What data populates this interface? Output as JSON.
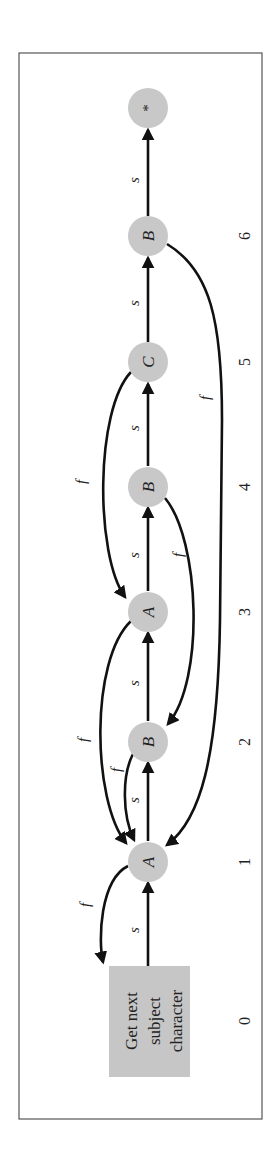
{
  "diagram": {
    "orientation": "rotated 90 degrees counter-clockwise",
    "start_box": {
      "lines": [
        "Get next",
        "subject",
        "character"
      ],
      "index": "0"
    },
    "nodes": [
      {
        "index": "1",
        "label": "A"
      },
      {
        "index": "2",
        "label": "B"
      },
      {
        "index": "3",
        "label": "A"
      },
      {
        "index": "4",
        "label": "B"
      },
      {
        "index": "5",
        "label": "C"
      },
      {
        "index": "6",
        "label": "B"
      },
      {
        "index": "7",
        "label": "*"
      }
    ],
    "success_label": "s",
    "failure_label": "f",
    "success_edges": [
      {
        "from": "0",
        "to": "1",
        "label": "s"
      },
      {
        "from": "1",
        "to": "2",
        "label": "s"
      },
      {
        "from": "2",
        "to": "3",
        "label": "s"
      },
      {
        "from": "3",
        "to": "4",
        "label": "s"
      },
      {
        "from": "4",
        "to": "5",
        "label": "s"
      },
      {
        "from": "5",
        "to": "6",
        "label": "s"
      },
      {
        "from": "6",
        "to": "7",
        "label": "s"
      }
    ],
    "failure_edges": [
      {
        "from": "1",
        "to": "0",
        "label": "f"
      },
      {
        "from": "2",
        "to": "1",
        "label": "f"
      },
      {
        "from": "3",
        "to": "1",
        "label": "f"
      },
      {
        "from": "4",
        "to": "2",
        "label": "f"
      },
      {
        "from": "5",
        "to": "3",
        "label": "f"
      },
      {
        "from": "6",
        "to": "1",
        "label": "f"
      }
    ],
    "index_labels": [
      "0",
      "1",
      "2",
      "3",
      "4",
      "5",
      "6"
    ],
    "colors": {
      "node_fill": "#c8c8c8",
      "edge": "#111111",
      "frame": "#555555",
      "background": "#ffffff"
    }
  }
}
